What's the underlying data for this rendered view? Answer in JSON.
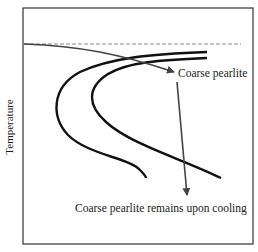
{
  "diagram": {
    "type": "TTT isothermal transformation diagram",
    "ylabel": "Temperature",
    "annotations": {
      "transformation_label": "Coarse pearlite",
      "cooling_label": "Coarse pearlite remains upon cooling"
    },
    "colors": {
      "frame": "#333333",
      "curves": "#111111",
      "arrows": "#444444",
      "dashed": "#888888"
    }
  }
}
